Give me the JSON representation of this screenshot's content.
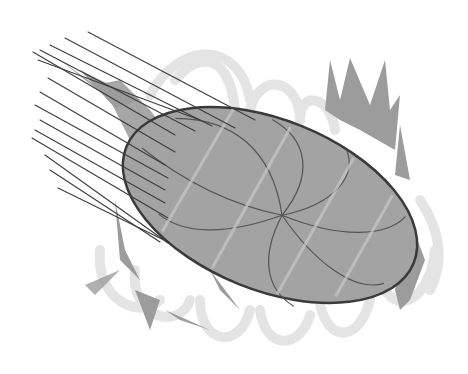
{
  "illustration": {
    "subject": "speeding disc with motion lines and flame-like streaks",
    "alt": "Grayscale sketch of a tilted oval disc with spiral seams, trailing speed lines and flickering flame shapes",
    "colors": {
      "background": "#ffffff",
      "disc_fill": "#a3a3a3",
      "disc_outline": "#3a3a3a",
      "seam": "#5a5a5a",
      "speed_line": "#3c3c3c",
      "flame_dark": "#9a9a9a",
      "flame_light": "#dcdcdc",
      "highlight": "#c8c8c8"
    }
  }
}
